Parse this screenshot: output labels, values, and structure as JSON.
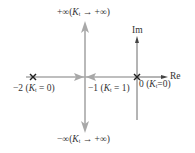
{
  "diagram": {
    "type": "root-locus",
    "axes": {
      "real_label": "Re",
      "imag_label": "Im"
    },
    "poles": [
      {
        "value": -2,
        "label_prefix": "−2 (",
        "label_var": "K",
        "label_sub": "t",
        "label_suffix": " = 0)"
      },
      {
        "value": 0,
        "label_prefix": "0 (",
        "label_var": "K",
        "label_sub": "t",
        "label_suffix": "=0)"
      }
    ],
    "breakaway": {
      "value": -1,
      "label_prefix": "−1 (",
      "label_var": "K",
      "label_sub": "t",
      "label_suffix": " = 1)"
    },
    "asymptotes": {
      "top": {
        "label_prefix": "+∞(",
        "label_var": "K",
        "label_sub": "t",
        "label_suffix": " → +∞)"
      },
      "bottom": {
        "label_prefix": "−∞(",
        "label_var": "K",
        "label_sub": "t",
        "label_suffix": " → +∞)"
      }
    },
    "colors": {
      "locus": "#a8a8a8",
      "axis": "#444444",
      "pole": "#222222",
      "text": "#333333"
    }
  }
}
